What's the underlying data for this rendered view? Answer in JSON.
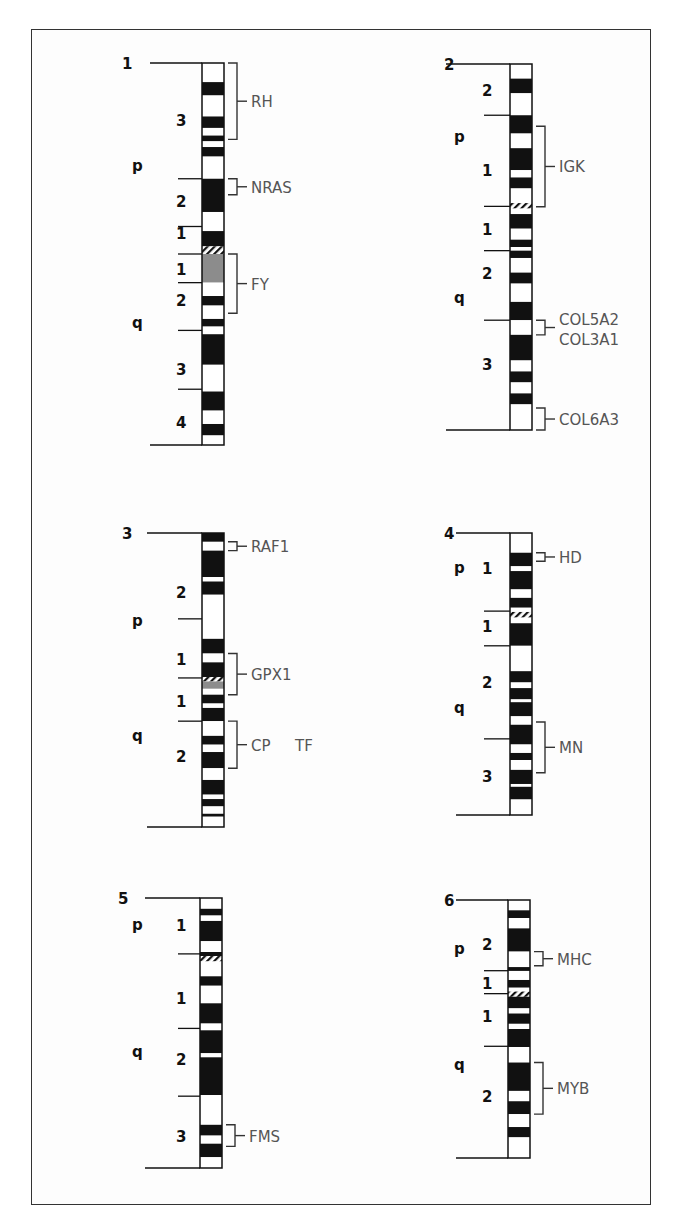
{
  "figure": {
    "type": "chromosome-ideograms",
    "colors": {
      "dark_band": "#111111",
      "light_band": "#ffffff",
      "grey_band": "#8c8c8c",
      "gene_text": "#555555",
      "label_text": "#111111"
    }
  },
  "chromosomes": [
    {
      "id": "1",
      "arm_labels": [
        {
          "text": "p",
          "pos": 0.27
        },
        {
          "text": "q",
          "pos": 0.68
        }
      ],
      "region_labels": [
        {
          "text": "3",
          "pos": 0.15
        },
        {
          "text": "2",
          "pos": 0.36
        },
        {
          "text": "1",
          "pos": 0.445
        },
        {
          "text": "1",
          "pos": 0.54
        },
        {
          "text": "2",
          "pos": 0.62
        },
        {
          "text": "3",
          "pos": 0.8
        },
        {
          "text": "4",
          "pos": 0.94
        }
      ],
      "boundaries": [
        0.0,
        0.303,
        0.428,
        0.5,
        0.575,
        0.7,
        0.854,
        1.0
      ],
      "centromere": [
        0.485,
        0.505
      ],
      "bands": [
        [
          "w",
          0,
          0.05
        ],
        [
          "b",
          0.05,
          0.085
        ],
        [
          "w",
          0.085,
          0.14
        ],
        [
          "b",
          0.14,
          0.17
        ],
        [
          "w",
          0.17,
          0.19
        ],
        [
          "b",
          0.19,
          0.205
        ],
        [
          "w",
          0.205,
          0.22
        ],
        [
          "b",
          0.22,
          0.245
        ],
        [
          "w",
          0.245,
          0.303
        ],
        [
          "b",
          0.303,
          0.39
        ],
        [
          "w",
          0.39,
          0.44
        ],
        [
          "b",
          0.44,
          0.48
        ],
        [
          "h",
          0.48,
          0.5
        ],
        [
          "g",
          0.5,
          0.575
        ],
        [
          "w",
          0.575,
          0.61
        ],
        [
          "b",
          0.61,
          0.635
        ],
        [
          "w",
          0.635,
          0.67
        ],
        [
          "b",
          0.67,
          0.69
        ],
        [
          "w",
          0.69,
          0.71
        ],
        [
          "b",
          0.71,
          0.79
        ],
        [
          "w",
          0.79,
          0.86
        ],
        [
          "b",
          0.86,
          0.91
        ],
        [
          "w",
          0.91,
          0.945
        ],
        [
          "b",
          0.945,
          0.975
        ],
        [
          "w",
          0.975,
          1.0
        ]
      ],
      "genes": [
        {
          "name": "RH",
          "from": 0.0,
          "to": 0.2
        },
        {
          "name": "NRAS",
          "from": 0.303,
          "to": 0.345
        },
        {
          "name": "FY",
          "from": 0.5,
          "to": 0.655
        }
      ]
    },
    {
      "id": "2",
      "arm_labels": [
        {
          "text": "p",
          "pos": 0.2
        },
        {
          "text": "q",
          "pos": 0.64
        }
      ],
      "region_labels": [
        {
          "text": "2",
          "pos": 0.07
        },
        {
          "text": "1",
          "pos": 0.29
        },
        {
          "text": "1",
          "pos": 0.45
        },
        {
          "text": "2",
          "pos": 0.57
        },
        {
          "text": "3",
          "pos": 0.82
        }
      ],
      "boundaries": [
        0.0,
        0.14,
        0.389,
        0.51,
        0.7,
        1.0
      ],
      "bands": [
        [
          "w",
          0,
          0.04
        ],
        [
          "b",
          0.04,
          0.08
        ],
        [
          "w",
          0.08,
          0.14
        ],
        [
          "b",
          0.14,
          0.19
        ],
        [
          "w",
          0.19,
          0.23
        ],
        [
          "b",
          0.23,
          0.29
        ],
        [
          "w",
          0.29,
          0.31
        ],
        [
          "b",
          0.31,
          0.34
        ],
        [
          "w",
          0.34,
          0.38
        ],
        [
          "h",
          0.38,
          0.395
        ],
        [
          "w",
          0.395,
          0.41
        ],
        [
          "b",
          0.41,
          0.45
        ],
        [
          "w",
          0.45,
          0.48
        ],
        [
          "b",
          0.48,
          0.5
        ],
        [
          "w",
          0.5,
          0.51
        ],
        [
          "b",
          0.51,
          0.53
        ],
        [
          "w",
          0.53,
          0.57
        ],
        [
          "b",
          0.57,
          0.6
        ],
        [
          "w",
          0.6,
          0.65
        ],
        [
          "b",
          0.65,
          0.7
        ],
        [
          "w",
          0.7,
          0.74
        ],
        [
          "b",
          0.74,
          0.81
        ],
        [
          "w",
          0.81,
          0.84
        ],
        [
          "b",
          0.84,
          0.87
        ],
        [
          "w",
          0.87,
          0.9
        ],
        [
          "b",
          0.9,
          0.93
        ],
        [
          "w",
          0.93,
          1.0
        ]
      ],
      "genes": [
        {
          "name": "IGK",
          "from": 0.17,
          "to": 0.39
        },
        {
          "name": "COL5A2",
          "from": 0.7,
          "to": 0.74,
          "second_line": "COL3A1"
        },
        {
          "name": "COL6A3",
          "from": 0.94,
          "to": 1.0
        }
      ]
    },
    {
      "id": "3",
      "arm_labels": [
        {
          "text": "p",
          "pos": 0.3
        },
        {
          "text": "q",
          "pos": 0.69
        }
      ],
      "region_labels": [
        {
          "text": "2",
          "pos": 0.2
        },
        {
          "text": "1",
          "pos": 0.43
        },
        {
          "text": "1",
          "pos": 0.57
        },
        {
          "text": "2",
          "pos": 0.76
        }
      ],
      "boundaries": [
        0.0,
        0.292,
        0.493,
        0.64,
        1.0
      ],
      "bands": [
        [
          "b",
          0,
          0.03
        ],
        [
          "w",
          0.03,
          0.06
        ],
        [
          "b",
          0.06,
          0.15
        ],
        [
          "w",
          0.15,
          0.165
        ],
        [
          "b",
          0.165,
          0.21
        ],
        [
          "w",
          0.21,
          0.36
        ],
        [
          "b",
          0.36,
          0.41
        ],
        [
          "w",
          0.41,
          0.44
        ],
        [
          "b",
          0.44,
          0.49
        ],
        [
          "h",
          0.49,
          0.505
        ],
        [
          "g",
          0.505,
          0.53
        ],
        [
          "w",
          0.53,
          0.55
        ],
        [
          "b",
          0.55,
          0.58
        ],
        [
          "w",
          0.58,
          0.595
        ],
        [
          "b",
          0.595,
          0.64
        ],
        [
          "w",
          0.64,
          0.69
        ],
        [
          "b",
          0.69,
          0.72
        ],
        [
          "w",
          0.72,
          0.745
        ],
        [
          "b",
          0.745,
          0.8
        ],
        [
          "w",
          0.8,
          0.84
        ],
        [
          "b",
          0.84,
          0.89
        ],
        [
          "w",
          0.89,
          0.905
        ],
        [
          "b",
          0.905,
          0.93
        ],
        [
          "w",
          0.93,
          0.955
        ],
        [
          "b",
          0.955,
          0.965
        ],
        [
          "w",
          0.965,
          1.0
        ]
      ],
      "genes": [
        {
          "name": "RAF1",
          "from": 0.03,
          "to": 0.06
        },
        {
          "name": "GPX1",
          "from": 0.41,
          "to": 0.55
        },
        {
          "name": "CP",
          "from": 0.64,
          "to": 0.8,
          "second_name": "TF"
        }
      ]
    },
    {
      "id": "4",
      "arm_labels": [
        {
          "text": "p",
          "pos": 0.125
        },
        {
          "text": "q",
          "pos": 0.62
        }
      ],
      "region_labels": [
        {
          "text": "1",
          "pos": 0.125
        },
        {
          "text": "1",
          "pos": 0.33
        },
        {
          "text": "2",
          "pos": 0.53
        },
        {
          "text": "3",
          "pos": 0.86
        }
      ],
      "boundaries": [
        0.0,
        0.277,
        0.4,
        0.73,
        1.0
      ],
      "bands": [
        [
          "w",
          0,
          0.07
        ],
        [
          "b",
          0.07,
          0.118
        ],
        [
          "w",
          0.118,
          0.135
        ],
        [
          "b",
          0.135,
          0.2
        ],
        [
          "w",
          0.2,
          0.23
        ],
        [
          "b",
          0.23,
          0.265
        ],
        [
          "w",
          0.265,
          0.28
        ],
        [
          "h",
          0.28,
          0.3
        ],
        [
          "w",
          0.3,
          0.32
        ],
        [
          "b",
          0.32,
          0.4
        ],
        [
          "w",
          0.4,
          0.49
        ],
        [
          "b",
          0.49,
          0.53
        ],
        [
          "w",
          0.53,
          0.55
        ],
        [
          "b",
          0.55,
          0.59
        ],
        [
          "w",
          0.59,
          0.6
        ],
        [
          "b",
          0.6,
          0.65
        ],
        [
          "w",
          0.65,
          0.68
        ],
        [
          "b",
          0.68,
          0.75
        ],
        [
          "w",
          0.75,
          0.78
        ],
        [
          "b",
          0.78,
          0.805
        ],
        [
          "w",
          0.805,
          0.84
        ],
        [
          "b",
          0.84,
          0.89
        ],
        [
          "w",
          0.89,
          0.9
        ],
        [
          "b",
          0.9,
          0.945
        ],
        [
          "w",
          0.945,
          1.0
        ]
      ],
      "genes": [
        {
          "name": "HD",
          "from": 0.07,
          "to": 0.1
        },
        {
          "name": "MN",
          "from": 0.67,
          "to": 0.85
        }
      ]
    },
    {
      "id": "5",
      "arm_labels": [
        {
          "text": "p",
          "pos": 0.1
        },
        {
          "text": "q",
          "pos": 0.57
        }
      ],
      "region_labels": [
        {
          "text": "1",
          "pos": 0.1
        },
        {
          "text": "1",
          "pos": 0.37
        },
        {
          "text": "2",
          "pos": 0.595
        },
        {
          "text": "3",
          "pos": 0.88
        }
      ],
      "boundaries": [
        0.0,
        0.207,
        0.483,
        0.734,
        1.0
      ],
      "bands": [
        [
          "w",
          0,
          0.04
        ],
        [
          "b",
          0.04,
          0.065
        ],
        [
          "w",
          0.065,
          0.085
        ],
        [
          "b",
          0.085,
          0.16
        ],
        [
          "w",
          0.16,
          0.2
        ],
        [
          "b",
          0.2,
          0.215
        ],
        [
          "h",
          0.215,
          0.235
        ],
        [
          "w",
          0.235,
          0.29
        ],
        [
          "b",
          0.29,
          0.325
        ],
        [
          "w",
          0.325,
          0.39
        ],
        [
          "b",
          0.39,
          0.465
        ],
        [
          "w",
          0.465,
          0.49
        ],
        [
          "b",
          0.49,
          0.575
        ],
        [
          "w",
          0.575,
          0.59
        ],
        [
          "b",
          0.59,
          0.73
        ],
        [
          "w",
          0.73,
          0.84
        ],
        [
          "b",
          0.84,
          0.88
        ],
        [
          "w",
          0.88,
          0.91
        ],
        [
          "b",
          0.91,
          0.96
        ],
        [
          "w",
          0.96,
          1.0
        ]
      ],
      "genes": [
        {
          "name": "FMS",
          "from": 0.84,
          "to": 0.92
        }
      ]
    },
    {
      "id": "6",
      "arm_labels": [
        {
          "text": "p",
          "pos": 0.19
        },
        {
          "text": "q",
          "pos": 0.64
        }
      ],
      "region_labels": [
        {
          "text": "2",
          "pos": 0.17
        },
        {
          "text": "1",
          "pos": 0.32
        },
        {
          "text": "1",
          "pos": 0.45
        },
        {
          "text": "2",
          "pos": 0.76
        }
      ],
      "boundaries": [
        0.0,
        0.274,
        0.363,
        0.567,
        1.0
      ],
      "bands": [
        [
          "w",
          0,
          0.04
        ],
        [
          "b",
          0.04,
          0.07
        ],
        [
          "w",
          0.07,
          0.11
        ],
        [
          "b",
          0.11,
          0.2
        ],
        [
          "w",
          0.2,
          0.26
        ],
        [
          "b",
          0.26,
          0.275
        ],
        [
          "w",
          0.275,
          0.31
        ],
        [
          "b",
          0.31,
          0.34
        ],
        [
          "w",
          0.34,
          0.355
        ],
        [
          "h",
          0.355,
          0.375
        ],
        [
          "b",
          0.375,
          0.42
        ],
        [
          "w",
          0.42,
          0.44
        ],
        [
          "b",
          0.44,
          0.48
        ],
        [
          "w",
          0.48,
          0.5
        ],
        [
          "b",
          0.5,
          0.57
        ],
        [
          "w",
          0.57,
          0.63
        ],
        [
          "b",
          0.63,
          0.74
        ],
        [
          "w",
          0.74,
          0.78
        ],
        [
          "b",
          0.78,
          0.83
        ],
        [
          "w",
          0.83,
          0.88
        ],
        [
          "b",
          0.88,
          0.92
        ],
        [
          "w",
          0.92,
          1.0
        ]
      ],
      "genes": [
        {
          "name": "MHC",
          "from": 0.2,
          "to": 0.255
        },
        {
          "name": "MYB",
          "from": 0.63,
          "to": 0.83
        }
      ]
    }
  ]
}
